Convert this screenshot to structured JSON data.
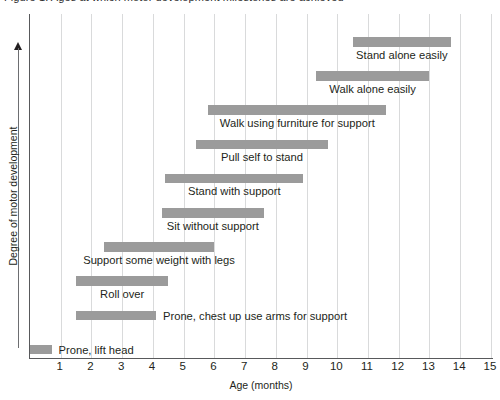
{
  "chart_data": {
    "type": "bar",
    "orientation": "horizontal-gantt",
    "title": "Figure 1: Ages at which motor development milestones are achieved",
    "xlabel": "Age (months)",
    "ylabel": "Degree of motor development",
    "xlim": [
      0,
      15.1
    ],
    "xticks": [
      1,
      2,
      3,
      4,
      5,
      6,
      7,
      8,
      9,
      10,
      11,
      12,
      13,
      14,
      15
    ],
    "grid": "vertical",
    "legend": "none",
    "bar_color": "#9b9b9b",
    "axis_color": "#58595b",
    "grid_color": "#d9dadb",
    "categories": [
      "Stand alone easily",
      "Walk alone easily",
      "Walk using furniture for support",
      "Pull self to stand",
      "Stand with support",
      "Sit without support",
      "Support some weight with legs",
      "Roll over",
      "Prone, chest up use arms for support",
      "Prone, lift head"
    ],
    "bars": [
      {
        "label": "Stand alone easily",
        "start": 10.5,
        "end": 13.7,
        "label_align": "below-center"
      },
      {
        "label": "Walk alone easily",
        "start": 9.3,
        "end": 13.0,
        "label_align": "below-center"
      },
      {
        "label": "Walk using furniture for support",
        "start": 5.8,
        "end": 11.6,
        "label_align": "below-center"
      },
      {
        "label": "Pull self to stand",
        "start": 5.4,
        "end": 9.7,
        "label_align": "below-center"
      },
      {
        "label": "Stand with support",
        "start": 4.4,
        "end": 8.9,
        "label_align": "below-center"
      },
      {
        "label": "Sit without support",
        "start": 4.3,
        "end": 7.6,
        "label_align": "below-center"
      },
      {
        "label": "Support some weight with legs",
        "start": 2.4,
        "end": 6.0,
        "label_align": "below-center"
      },
      {
        "label": "Roll over",
        "start": 1.5,
        "end": 4.5,
        "label_align": "below-center"
      },
      {
        "label": "Prone, chest up use arms for support",
        "start": 1.5,
        "end": 4.1,
        "label_align": "right-inline"
      },
      {
        "label": "Prone, lift head",
        "start": 0.0,
        "end": 0.7,
        "label_align": "right-inline"
      }
    ]
  }
}
